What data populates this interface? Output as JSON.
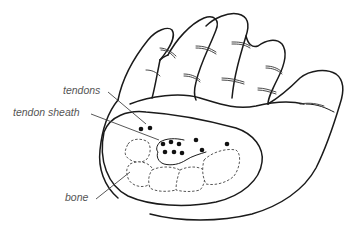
{
  "figure": {
    "labels": {
      "tendons": "tendons",
      "tendon_sheath": "tendon sheath",
      "bone": "bone"
    },
    "colors": {
      "line": "#1a1a1a",
      "label_text": "#555555",
      "background": "#ffffff"
    }
  }
}
